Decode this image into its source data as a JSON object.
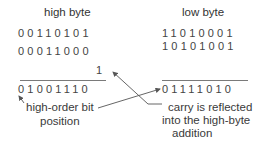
{
  "high_byte": {
    "title": "high byte",
    "operand1": "00110101",
    "operand2": "00011000",
    "carry_in": "1",
    "result": "01001110"
  },
  "low_byte": {
    "title": "low byte",
    "operand1": "11010001",
    "operand2": "10101001",
    "result": "01111010"
  },
  "annotations": {
    "high_order_line1": "high-order bit",
    "high_order_line2": "position",
    "carry_line1": "carry is reflected",
    "carry_line2": "into the high-byte",
    "carry_line3": "addition"
  },
  "colors": {
    "text": "#3a3a3a",
    "line": "#6a6a6a",
    "arrow": "#555555"
  }
}
